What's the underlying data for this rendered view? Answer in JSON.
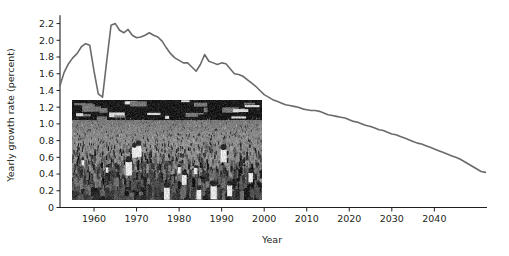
{
  "figure": {
    "background_color": "#ffffff",
    "line_color": "#6a6a6a",
    "axis_color": "#231f20",
    "text_color": "#231f20"
  },
  "axes": {
    "x_title": "Year",
    "y_title": "Yearly growth rate (percent)",
    "x_ticks": [
      "1960",
      "1970",
      "1980",
      "1990",
      "2000",
      "2010",
      "2020",
      "2030",
      "2040"
    ],
    "y_ticks": [
      "0",
      "0.2",
      "0.4",
      "0.6",
      "0.8",
      "1.0",
      "1.2",
      "1.4",
      "1.6",
      "1.8",
      "2.0",
      "2.2"
    ]
  },
  "photo": {
    "caption": "",
    "alt_name": "crowd-photograph",
    "description": "black and white photograph of a dense crowd of people in a street",
    "x": 72,
    "y": 100,
    "width": 190,
    "height": 100
  },
  "chart_data": {
    "type": "line",
    "title": "",
    "xlabel": "Year",
    "ylabel": "Yearly growth rate (percent)",
    "xlim": [
      1952,
      2052
    ],
    "ylim": [
      0,
      2.3
    ],
    "grid": false,
    "legend": null,
    "x": [
      1952,
      1953,
      1954,
      1955,
      1956,
      1957,
      1958,
      1959,
      1960,
      1961,
      1962,
      1963,
      1964,
      1965,
      1966,
      1967,
      1968,
      1969,
      1970,
      1971,
      1972,
      1973,
      1974,
      1975,
      1976,
      1977,
      1978,
      1979,
      1980,
      1981,
      1982,
      1983,
      1984,
      1985,
      1986,
      1987,
      1988,
      1989,
      1990,
      1991,
      1992,
      1993,
      1994,
      1995,
      1996,
      1997,
      1998,
      1999,
      2000,
      2001,
      2002,
      2003,
      2004,
      2005,
      2006,
      2007,
      2008,
      2009,
      2010,
      2011,
      2012,
      2013,
      2014,
      2015,
      2016,
      2017,
      2018,
      2019,
      2020,
      2021,
      2022,
      2023,
      2024,
      2025,
      2026,
      2027,
      2028,
      2029,
      2030,
      2031,
      2032,
      2033,
      2034,
      2035,
      2036,
      2037,
      2038,
      2039,
      2040,
      2041,
      2042,
      2043,
      2044,
      2045,
      2046,
      2047,
      2048,
      2049,
      2050,
      2051,
      2052
    ],
    "y": [
      1.46,
      1.62,
      1.72,
      1.79,
      1.84,
      1.92,
      1.96,
      1.94,
      1.63,
      1.36,
      1.32,
      1.76,
      2.18,
      2.2,
      2.12,
      2.09,
      2.13,
      2.06,
      2.03,
      2.04,
      2.06,
      2.09,
      2.06,
      2.04,
      1.99,
      1.91,
      1.84,
      1.79,
      1.76,
      1.73,
      1.73,
      1.68,
      1.63,
      1.71,
      1.83,
      1.75,
      1.73,
      1.71,
      1.73,
      1.72,
      1.66,
      1.6,
      1.59,
      1.57,
      1.53,
      1.49,
      1.45,
      1.4,
      1.35,
      1.32,
      1.29,
      1.27,
      1.25,
      1.23,
      1.22,
      1.21,
      1.2,
      1.18,
      1.17,
      1.16,
      1.16,
      1.15,
      1.13,
      1.11,
      1.1,
      1.09,
      1.08,
      1.07,
      1.05,
      1.03,
      1.02,
      1.0,
      0.98,
      0.97,
      0.95,
      0.93,
      0.92,
      0.9,
      0.88,
      0.87,
      0.85,
      0.83,
      0.81,
      0.79,
      0.77,
      0.76,
      0.74,
      0.72,
      0.7,
      0.68,
      0.66,
      0.64,
      0.62,
      0.6,
      0.58,
      0.55,
      0.52,
      0.49,
      0.46,
      0.43,
      0.42
    ]
  }
}
